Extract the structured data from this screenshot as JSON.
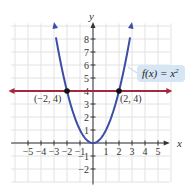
{
  "chart_data": {
    "type": "line",
    "title": "",
    "xlabel": "x",
    "ylabel": "y",
    "xlim": [
      -6,
      6
    ],
    "ylim": [
      -3,
      9
    ],
    "grid": true,
    "x_ticks": [
      -5,
      -4,
      -3,
      -2,
      -1,
      1,
      2,
      3,
      4,
      5
    ],
    "y_ticks": [
      -2,
      -1,
      1,
      2,
      3,
      4,
      5,
      6,
      7,
      8
    ],
    "x_tick_labels": [
      "−5",
      "−4",
      "−3",
      "−2",
      "−1",
      "1",
      "2",
      "3",
      "4",
      "5"
    ],
    "y_tick_labels": [
      "−2",
      "−1",
      "1",
      "2",
      "3",
      "4",
      "5",
      "6",
      "7",
      "8"
    ],
    "series": [
      {
        "name": "f(x) = x²",
        "kind": "parabola",
        "color": "#3b4ea6",
        "x": [
          -3,
          -2,
          -1,
          0,
          1,
          2,
          3
        ],
        "y": [
          9,
          4,
          1,
          0,
          1,
          4,
          9
        ]
      },
      {
        "name": "y = 4",
        "kind": "horizontal-line",
        "color": "#a3283f",
        "x": [
          -6,
          6
        ],
        "y": [
          4,
          4
        ]
      }
    ],
    "points": [
      {
        "x": -2,
        "y": 4,
        "label": "(−2, 4)"
      },
      {
        "x": 2,
        "y": 4,
        "label": "(2, 4)"
      }
    ],
    "annotations": [
      {
        "text": "f(x) = x²",
        "target_series": "f(x) = x²"
      }
    ]
  },
  "labels": {
    "x_axis": "x",
    "y_axis": "y",
    "function": "f(x) = x",
    "exponent": "2",
    "point_left": "(−2, 4)",
    "point_right": "(2, 4)"
  },
  "colors": {
    "parabola": "#3b4ea6",
    "line": "#a3283f",
    "grid": "#e2e2e2",
    "axis": "#333333",
    "label_box": "#d6e6f5"
  }
}
